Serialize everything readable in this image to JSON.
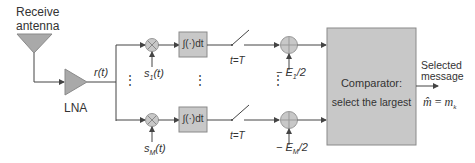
{
  "diagram": {
    "type": "block-diagram",
    "antenna": {
      "label_line1": "Receive",
      "label_line2": "antenna"
    },
    "amplifier": {
      "label": "LNA"
    },
    "signal": {
      "label": "r(t)"
    },
    "branches": [
      {
        "id": "top",
        "reference_signal": "s",
        "reference_sub": "1",
        "reference_arg": "(t)",
        "integrator": "∫(·)dt",
        "switch_label": "t=T",
        "bias_prefix": "− E",
        "bias_sub": "1",
        "bias_suffix": "/2"
      },
      {
        "id": "bottom",
        "reference_signal": "s",
        "reference_sub": "M",
        "reference_arg": "(t)",
        "integrator": "∫(·)dt",
        "switch_label": "t=T",
        "bias_prefix": "− E",
        "bias_sub": "M",
        "bias_suffix": "/2"
      }
    ],
    "ellipsis": "⋮",
    "comparator": {
      "line1": "Comparator:",
      "line2": "select the largest"
    },
    "output": {
      "label_line1": "Selected",
      "label_line2": "message",
      "formula_lhs": "m̂",
      "formula_eq": " = ",
      "formula_rhs": "m",
      "formula_sub": "k"
    },
    "colors": {
      "block_fill": "#c8c8c8",
      "block_stroke": "#8a8a8a",
      "line": "#444444",
      "triangle_fill": "#a9a9a9"
    }
  }
}
